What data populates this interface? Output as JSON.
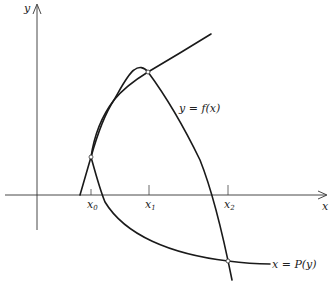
{
  "diagram": {
    "type": "function-iteration-graph",
    "axes": {
      "x_label": "x",
      "y_label": "y"
    },
    "ticks": [
      {
        "label": "x",
        "sub": "0"
      },
      {
        "label": "x",
        "sub": "1"
      },
      {
        "label": "x",
        "sub": "2"
      }
    ],
    "curves": [
      {
        "name": "f",
        "label": "y = f(x)"
      },
      {
        "name": "P",
        "label": "x = P(y)"
      }
    ],
    "intersection_points": 3
  }
}
